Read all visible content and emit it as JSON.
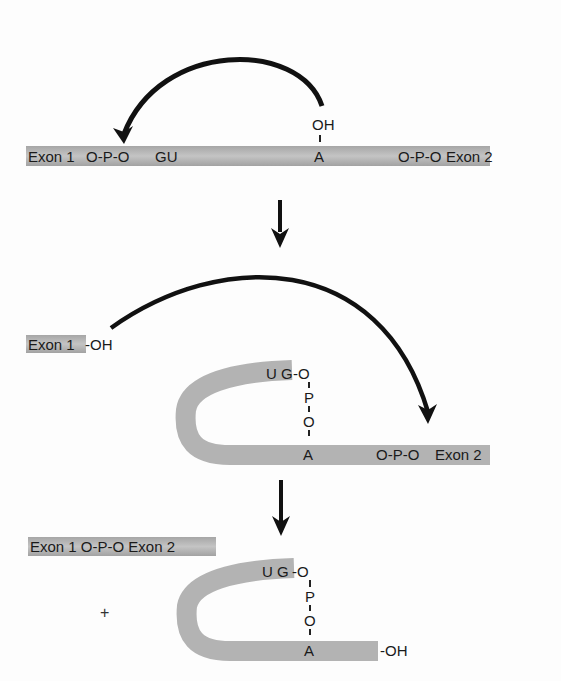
{
  "diagram": {
    "colors": {
      "rna_strand": "#b5b5b5",
      "rna_dark": "#9a9a9a",
      "arrow": "#111111",
      "text": "#1a1a1a"
    },
    "step1": {
      "exon1": "Exon 1",
      "phosphate_left": "O-P-O",
      "gu": "GU",
      "branch_oh": "OH",
      "branch_a": "A",
      "phosphate_right": "O-P-O",
      "exon2": "Exon 2"
    },
    "step2": {
      "exon1_oh": "Exon 1",
      "oh_suffix": "-OH",
      "ug": "U G",
      "link_o1": "-O",
      "link_p": "P",
      "link_o2": "O",
      "branch_a": "A",
      "phosphate": "O-P-O",
      "exon2": "Exon 2"
    },
    "step3": {
      "ligated": "Exon 1 O-P-O Exon 2",
      "plus": "+",
      "ug": "U G",
      "link_o1": "-O",
      "link_p": "P",
      "link_o2": "O",
      "branch_a": "A",
      "tail_oh": "-OH"
    }
  }
}
